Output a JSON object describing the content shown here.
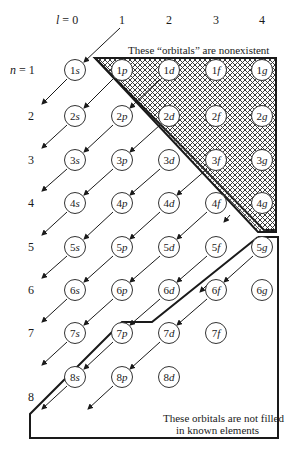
{
  "diagram": {
    "l_axis": {
      "prefix": "l = ",
      "values": [
        "0",
        "1",
        "2",
        "3",
        "4"
      ]
    },
    "n_axis": {
      "prefix": "n = ",
      "values": [
        "1",
        "2",
        "3",
        "4",
        "5",
        "6",
        "7",
        "8"
      ]
    },
    "subshell_letters": [
      "s",
      "p",
      "d",
      "f",
      "g"
    ],
    "nonexistent_note": "These “orbitals” are nonexistent",
    "unfilled_note_line1": "These orbitals are not filled",
    "unfilled_note_line2": "in known elements",
    "orbitals": [
      {
        "n": "1",
        "l": "s"
      },
      {
        "n": "1",
        "l": "p"
      },
      {
        "n": "1",
        "l": "d"
      },
      {
        "n": "1",
        "l": "f"
      },
      {
        "n": "1",
        "l": "g"
      },
      {
        "n": "2",
        "l": "s"
      },
      {
        "n": "2",
        "l": "p"
      },
      {
        "n": "2",
        "l": "d"
      },
      {
        "n": "2",
        "l": "f"
      },
      {
        "n": "2",
        "l": "g"
      },
      {
        "n": "3",
        "l": "s"
      },
      {
        "n": "3",
        "l": "p"
      },
      {
        "n": "3",
        "l": "d"
      },
      {
        "n": "3",
        "l": "f"
      },
      {
        "n": "3",
        "l": "g"
      },
      {
        "n": "4",
        "l": "s"
      },
      {
        "n": "4",
        "l": "p"
      },
      {
        "n": "4",
        "l": "d"
      },
      {
        "n": "4",
        "l": "f"
      },
      {
        "n": "4",
        "l": "g"
      },
      {
        "n": "5",
        "l": "s"
      },
      {
        "n": "5",
        "l": "p"
      },
      {
        "n": "5",
        "l": "d"
      },
      {
        "n": "5",
        "l": "f"
      },
      {
        "n": "5",
        "l": "g"
      },
      {
        "n": "6",
        "l": "s"
      },
      {
        "n": "6",
        "l": "p"
      },
      {
        "n": "6",
        "l": "d"
      },
      {
        "n": "6",
        "l": "f"
      },
      {
        "n": "6",
        "l": "g"
      },
      {
        "n": "7",
        "l": "s"
      },
      {
        "n": "7",
        "l": "p"
      },
      {
        "n": "7",
        "l": "d"
      },
      {
        "n": "7",
        "l": "f"
      },
      {
        "n": "8",
        "l": "s"
      },
      {
        "n": "8",
        "l": "p"
      },
      {
        "n": "8",
        "l": "d"
      }
    ],
    "colors": {
      "line": "#1a1a1a",
      "hatch": "#333333",
      "background": "#ffffff"
    }
  }
}
